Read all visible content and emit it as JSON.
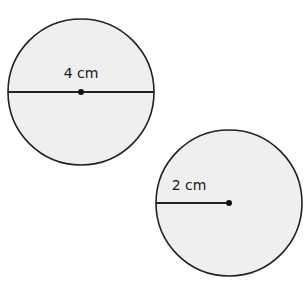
{
  "diagram": {
    "circles": [
      {
        "id": "diameter-circle",
        "cx": 81,
        "cy": 92,
        "r": 73,
        "measure": "diameter",
        "label": "4 cm",
        "label_x": 81,
        "label_y": 78
      },
      {
        "id": "radius-circle",
        "cx": 229,
        "cy": 203,
        "r": 73,
        "measure": "radius",
        "label": "2 cm",
        "label_x": 189,
        "label_y": 190
      }
    ],
    "colors": {
      "fill": "#efefef",
      "stroke": "#222222"
    }
  }
}
